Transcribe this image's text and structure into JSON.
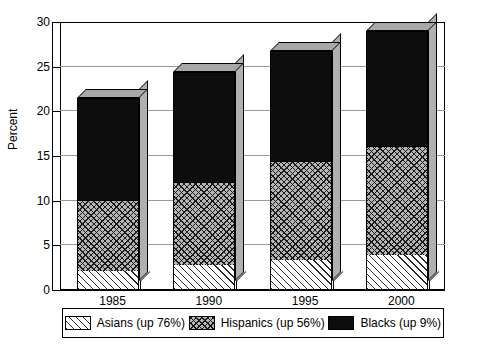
{
  "chart_data": {
    "type": "bar",
    "subtype": "stacked-3d-column",
    "title": "",
    "xlabel": "",
    "ylabel": "Percent",
    "categories": [
      "1985",
      "1990",
      "1995",
      "2000"
    ],
    "ylim": [
      0,
      30
    ],
    "yticks": [
      0,
      5,
      10,
      15,
      20,
      25,
      30
    ],
    "grid": true,
    "legend_position": "bottom",
    "series": [
      {
        "name": "Asians (up 76%)",
        "key": "asians",
        "fill": "diagonal-hatch",
        "values": [
          2.0,
          2.7,
          3.2,
          3.8
        ]
      },
      {
        "name": "Hispanics (up 56%)",
        "key": "hispanics",
        "fill": "cross-hatch",
        "values": [
          8.0,
          9.3,
          11.1,
          12.2
        ]
      },
      {
        "name": "Blacks (up 9%)",
        "key": "blacks",
        "fill": "solid-black",
        "values": [
          11.5,
          12.4,
          12.5,
          13.0
        ]
      }
    ],
    "stack_totals": [
      21.5,
      24.4,
      26.8,
      29.0
    ],
    "colors": {
      "blacks": "#0d0d0d",
      "hispanics_bg": "#b6b6b6",
      "asians_bg": "#ffffff",
      "bar_side": "#b0b0b0",
      "bar_top": "#a8a8a8",
      "gridline": "#9a9a9a",
      "axis": "#000000",
      "background": "#ffffff"
    }
  },
  "legend": {
    "items": [
      {
        "label": "Asians (up 76%)"
      },
      {
        "label": "Hispanics (up 56%)"
      },
      {
        "label": "Blacks (up 9%)"
      }
    ]
  },
  "axis": {
    "y_title": "Percent",
    "y_tick_labels": [
      "0",
      "5",
      "10",
      "15",
      "20",
      "25",
      "30"
    ],
    "x_tick_labels": [
      "1985",
      "1990",
      "1995",
      "2000"
    ]
  }
}
